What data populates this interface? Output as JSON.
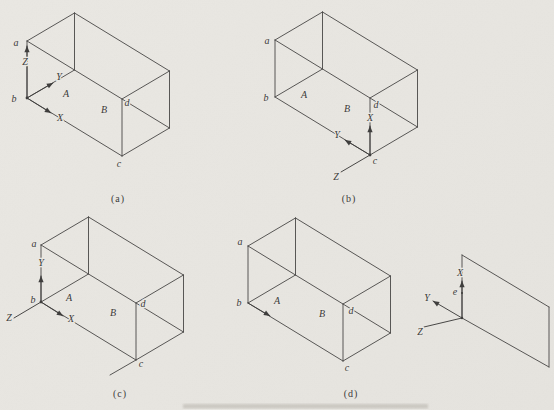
{
  "figures": {
    "a": {
      "caption": "(a)",
      "points": {
        "a": "a",
        "b": "b",
        "c": "c",
        "d": "d"
      },
      "faces": {
        "A": "A",
        "B": "B"
      },
      "axes": {
        "x": "X",
        "y": "Y",
        "z": "Z"
      }
    },
    "b": {
      "caption": "(b)",
      "points": {
        "a": "a",
        "b": "b",
        "c": "c",
        "d": "d"
      },
      "faces": {
        "A": "A",
        "B": "B"
      },
      "axes": {
        "x": "X",
        "y": "Y",
        "z": "Z"
      }
    },
    "c": {
      "caption": "(c)",
      "points": {
        "a": "a",
        "b": "b",
        "c": "c",
        "d": "d"
      },
      "faces": {
        "A": "A",
        "B": "B"
      },
      "axes": {
        "x": "X",
        "y": "Y",
        "z": "Z"
      }
    },
    "d": {
      "caption": "(d)",
      "points": {
        "a": "a",
        "b": "b",
        "c": "c",
        "d": "d"
      },
      "faces": {
        "A": "A",
        "B": "B"
      }
    }
  },
  "plane": {
    "axes": {
      "x": "X",
      "y": "Y",
      "z": "Z"
    },
    "point_e": "e"
  },
  "colors": {
    "paper": "#e9e7e2",
    "ink": "#474645"
  }
}
